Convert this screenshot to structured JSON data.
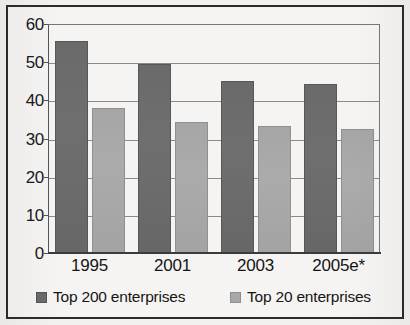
{
  "chart_data": {
    "type": "bar",
    "title": "",
    "subtitle": "",
    "xlabel": "",
    "ylabel": "",
    "categories": [
      "1995",
      "2001",
      "2003",
      "2005e*"
    ],
    "series": [
      {
        "name": "Top 200 enterprises",
        "color": "#6e6e6e",
        "values": [
          55.5,
          49.5,
          45.2,
          44.2
        ]
      },
      {
        "name": "Top 20 enterprises",
        "color": "#a8a8a8",
        "values": [
          38.0,
          34.3,
          33.3,
          32.4
        ]
      }
    ],
    "ylim": [
      0,
      60
    ],
    "yticks": [
      0,
      10,
      20,
      30,
      40,
      50,
      60
    ],
    "ytick_labels": [
      "0",
      "10",
      "20",
      "30",
      "40",
      "50",
      "60"
    ],
    "grid": true,
    "grid_axis": "y",
    "legend_position": "bottom",
    "legend_entries": [
      "Top 200 enterprises",
      "Top 20 enterprises"
    ]
  },
  "axis": {
    "y_labels": [
      "60",
      "50",
      "40",
      "30",
      "20",
      "10",
      "0"
    ]
  },
  "legend": {
    "items": [
      {
        "label": "Top 200 enterprises"
      },
      {
        "label": "Top 20 enterprises"
      }
    ]
  }
}
